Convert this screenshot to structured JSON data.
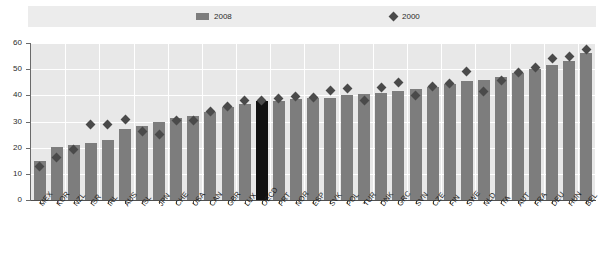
{
  "legend": {
    "items": [
      {
        "label": "2008",
        "marker": "bar-swatch-icon",
        "color": "#7d7d7d"
      },
      {
        "label": "2000",
        "marker": "diamond-marker-icon",
        "color": "#4a4a4a"
      }
    ]
  },
  "axis": {
    "y_ticks": [
      "0",
      "10",
      "20",
      "30",
      "40",
      "50",
      "60"
    ]
  },
  "chart_data": {
    "type": "bar",
    "title": "",
    "subtitle": "",
    "xlabel": "",
    "ylabel": "",
    "ylim": [
      0,
      60
    ],
    "grid": true,
    "legend_position": "top",
    "categories": [
      "MEX",
      "KOR",
      "NZL",
      "ISR",
      "IRL",
      "AUS",
      "ISL",
      "JPN",
      "CHE",
      "USA",
      "CAN",
      "GBR",
      "LUX",
      "OECD",
      "PRT",
      "NOR",
      "ESP",
      "SVK",
      "POL",
      "TUR",
      "DNK",
      "GRC",
      "SVN",
      "CZE",
      "FIN",
      "SWE",
      "NLD",
      "ITA",
      "AUT",
      "FRA",
      "DEU",
      "HUN",
      "BEL"
    ],
    "highlight_category": "OECD",
    "highlight_color": "#111111",
    "series": [
      {
        "name": "2008",
        "type": "bar",
        "color": "#7d7d7d",
        "values": [
          15.0,
          20.4,
          21.0,
          21.7,
          23.0,
          27.0,
          28.4,
          29.8,
          31.2,
          32.2,
          33.5,
          35.5,
          36.5,
          38.0,
          38.0,
          38.5,
          38.8,
          39.0,
          40.0,
          40.5,
          41.0,
          41.5,
          42.5,
          43.2,
          44.2,
          45.5,
          46.0,
          47.0,
          48.5,
          50.0,
          51.5,
          53.0,
          56.0
        ]
      },
      {
        "name": "2000",
        "type": "scatter",
        "marker": "diamond",
        "color": "#4a4a4a",
        "values": [
          12.8,
          16.4,
          19.4,
          29.0,
          29.0,
          30.7,
          26.3,
          25.0,
          30.2,
          30.5,
          33.8,
          35.9,
          38.2,
          38.0,
          38.8,
          39.6,
          39.3,
          42.0,
          42.5,
          38.2,
          43.0,
          45.0,
          40.0,
          43.5,
          44.5,
          49.0,
          41.5,
          45.5,
          48.9,
          50.5,
          54.2,
          55.0,
          57.5
        ]
      }
    ]
  }
}
